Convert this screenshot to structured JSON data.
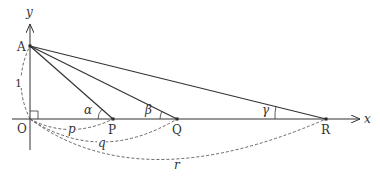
{
  "diagram": {
    "axes": {
      "x_label": "x",
      "y_label": "y"
    },
    "points": {
      "A": {
        "label": "A",
        "x": 30,
        "y": 46
      },
      "O": {
        "label": "O",
        "x": 30,
        "y": 119
      },
      "P": {
        "label": "P",
        "x": 113,
        "y": 119
      },
      "Q": {
        "label": "Q",
        "x": 177,
        "y": 119
      },
      "R": {
        "label": "R",
        "x": 326,
        "y": 119
      }
    },
    "angles": {
      "alpha": "α",
      "beta": "β",
      "gamma": "γ"
    },
    "lengths": {
      "OA": "1",
      "OP": "p",
      "OQ": "q",
      "OR": "r"
    },
    "colors": {
      "line": "#333333",
      "dashed": "#555555",
      "background": "#ffffff"
    }
  }
}
